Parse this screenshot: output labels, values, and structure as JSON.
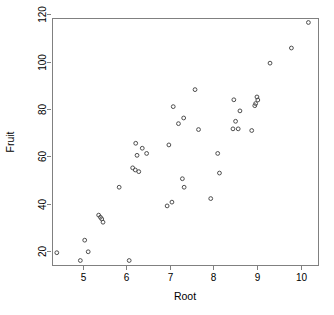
{
  "chart_data": {
    "type": "scatter",
    "title": "",
    "xlabel": "Root",
    "ylabel": "Fruit",
    "xlim": [
      4.3,
      10.4
    ],
    "ylim": [
      14.0,
      118.5
    ],
    "xticks": [
      5,
      6,
      7,
      8,
      9,
      10
    ],
    "yticks": [
      20,
      40,
      60,
      80,
      100,
      120
    ],
    "xtick_labels": [
      "5",
      "6",
      "7",
      "8",
      "9",
      "10"
    ],
    "ytick_labels": [
      "20",
      "40",
      "60",
      "80",
      "100",
      "120"
    ],
    "grid": false,
    "legend": null,
    "point_marker": "open-circle",
    "point_color": "#4d4d4d",
    "n_points": 46,
    "points": [
      {
        "x": 4.41,
        "y": 19.2
      },
      {
        "x": 4.95,
        "y": 15.9
      },
      {
        "x": 5.05,
        "y": 24.5
      },
      {
        "x": 5.13,
        "y": 19.6
      },
      {
        "x": 5.37,
        "y": 35.1
      },
      {
        "x": 5.41,
        "y": 34.2
      },
      {
        "x": 5.44,
        "y": 33.5
      },
      {
        "x": 5.47,
        "y": 32.1
      },
      {
        "x": 5.84,
        "y": 46.9
      },
      {
        "x": 6.07,
        "y": 15.9
      },
      {
        "x": 6.15,
        "y": 55.1
      },
      {
        "x": 6.21,
        "y": 54.2
      },
      {
        "x": 6.22,
        "y": 65.5
      },
      {
        "x": 6.25,
        "y": 60.4
      },
      {
        "x": 6.29,
        "y": 53.5
      },
      {
        "x": 6.37,
        "y": 63.4
      },
      {
        "x": 6.47,
        "y": 61.2
      },
      {
        "x": 6.94,
        "y": 39.0
      },
      {
        "x": 6.98,
        "y": 64.8
      },
      {
        "x": 7.05,
        "y": 40.6
      },
      {
        "x": 7.08,
        "y": 81.0
      },
      {
        "x": 7.2,
        "y": 73.8
      },
      {
        "x": 7.29,
        "y": 50.5
      },
      {
        "x": 7.32,
        "y": 76.2
      },
      {
        "x": 7.33,
        "y": 46.9
      },
      {
        "x": 7.58,
        "y": 88.2
      },
      {
        "x": 7.66,
        "y": 71.3
      },
      {
        "x": 7.94,
        "y": 42.1
      },
      {
        "x": 8.1,
        "y": 61.2
      },
      {
        "x": 8.14,
        "y": 52.9
      },
      {
        "x": 8.45,
        "y": 71.6
      },
      {
        "x": 8.47,
        "y": 83.9
      },
      {
        "x": 8.51,
        "y": 74.8
      },
      {
        "x": 8.57,
        "y": 71.6
      },
      {
        "x": 8.61,
        "y": 79.2
      },
      {
        "x": 8.88,
        "y": 70.9
      },
      {
        "x": 8.95,
        "y": 81.4
      },
      {
        "x": 8.97,
        "y": 82.3
      },
      {
        "x": 9.0,
        "y": 85.1
      },
      {
        "x": 9.02,
        "y": 83.8
      },
      {
        "x": 9.3,
        "y": 99.4
      },
      {
        "x": 9.79,
        "y": 105.8
      },
      {
        "x": 10.18,
        "y": 116.6
      }
    ]
  },
  "axes": {
    "x_axis_name": "Root",
    "y_axis_name": "Fruit"
  }
}
